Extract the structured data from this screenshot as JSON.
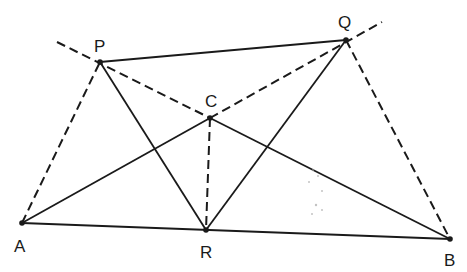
{
  "diagram": {
    "title": "",
    "stroke_color": "#1a1a1a",
    "points": {
      "P": {
        "label": "P",
        "x": 100,
        "y": 62,
        "lx": 94,
        "ly": 52
      },
      "Q": {
        "label": "Q",
        "x": 346,
        "y": 40,
        "lx": 338,
        "ly": 28
      },
      "C": {
        "label": "C",
        "x": 210,
        "y": 118,
        "lx": 205,
        "ly": 107
      },
      "A": {
        "label": "A",
        "x": 22,
        "y": 223,
        "lx": 14,
        "ly": 252
      },
      "R": {
        "label": "R",
        "x": 206,
        "y": 230,
        "lx": 200,
        "ly": 258
      },
      "B": {
        "label": "B",
        "x": 450,
        "y": 239,
        "lx": 444,
        "ly": 266
      }
    },
    "solid_segments": [
      [
        "P",
        "Q"
      ],
      [
        "P",
        "R"
      ],
      [
        "Q",
        "R"
      ],
      [
        "A",
        "C"
      ],
      [
        "A",
        "B"
      ],
      [
        "C",
        "B"
      ]
    ],
    "dashed_segments": [
      {
        "from": [
          57,
          42
        ],
        "to": "C",
        "name": "dashed-line-through-p-c"
      },
      {
        "from": "C",
        "to": [
          382,
          22
        ],
        "name": "dashed-line-through-c-q"
      },
      {
        "from": "A",
        "to": "P",
        "name": "dashed-segment-ap"
      },
      {
        "from": "Q",
        "to": "B",
        "name": "dashed-segment-qb"
      },
      {
        "from": "C",
        "to": "R",
        "name": "dashed-segment-cr"
      }
    ]
  }
}
